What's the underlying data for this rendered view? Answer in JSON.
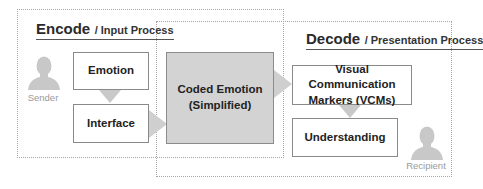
{
  "encode": {
    "title": "Encode",
    "subtitle": "/ Input Process",
    "actor_label": "Sender",
    "actor_icon": "person-silhouette-icon",
    "steps": [
      {
        "label": "Emotion"
      },
      {
        "label": "Interface"
      }
    ]
  },
  "coded": {
    "line1": "Coded Emotion",
    "line2": "(Simplified)"
  },
  "decode": {
    "title": "Decode",
    "subtitle": "/ Presentation Process",
    "actor_label": "Recipient",
    "actor_icon": "person-silhouette-icon",
    "steps": [
      {
        "line1": "Visual Communication",
        "line2": "Markers (VCMs)"
      },
      {
        "label": "Understanding"
      }
    ]
  },
  "colors": {
    "coded_fill": "#d3d3d3",
    "arrow": "#cccccc",
    "frame": "#a8a8a8",
    "icon": "#c8c8c8"
  }
}
